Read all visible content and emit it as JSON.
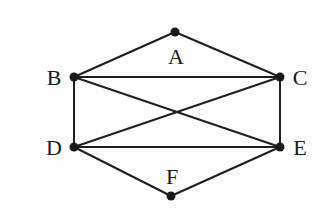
{
  "diagram": {
    "type": "graph",
    "nodes": [
      {
        "id": "A",
        "label": "A",
        "x": 175,
        "y": 32,
        "lx": 176,
        "ly": 64
      },
      {
        "id": "B",
        "label": "B",
        "x": 74,
        "y": 77,
        "lx": 54,
        "ly": 85
      },
      {
        "id": "C",
        "label": "C",
        "x": 280,
        "y": 77,
        "lx": 300,
        "ly": 85
      },
      {
        "id": "D",
        "label": "D",
        "x": 74,
        "y": 147,
        "lx": 54,
        "ly": 155
      },
      {
        "id": "E",
        "label": "E",
        "x": 280,
        "y": 147,
        "lx": 300,
        "ly": 155
      },
      {
        "id": "F",
        "label": "F",
        "x": 171,
        "y": 196,
        "lx": 172,
        "ly": 184
      }
    ],
    "edges": [
      [
        "A",
        "B"
      ],
      [
        "A",
        "C"
      ],
      [
        "B",
        "C"
      ],
      [
        "B",
        "D"
      ],
      [
        "B",
        "E"
      ],
      [
        "C",
        "D"
      ],
      [
        "C",
        "E"
      ],
      [
        "D",
        "E"
      ],
      [
        "D",
        "F"
      ],
      [
        "E",
        "F"
      ]
    ]
  }
}
